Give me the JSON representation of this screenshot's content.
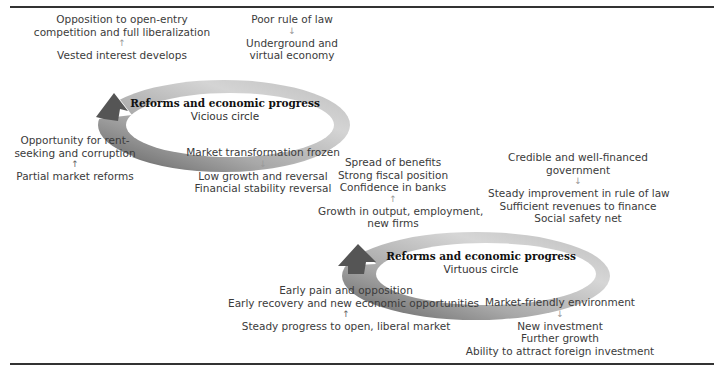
{
  "vicious": {
    "title": "Reforms and economic progress",
    "subtitle": "Vicious circle",
    "top_left": {
      "lines": [
        "Opposition to open-entry",
        "competition and full liberalization"
      ],
      "arrow": "↑",
      "lines2": [
        "Vested interest develops"
      ]
    },
    "top_right": {
      "lines": [
        "Poor rule of law"
      ],
      "arrow": "↓",
      "lines2": [
        "Underground and",
        "virtual economy"
      ]
    },
    "bottom_left": {
      "lines": [
        "Opportunity for rent-",
        "seeking and corruption"
      ],
      "arrow": "↑",
      "lines2": [
        "Partial market reforms"
      ]
    },
    "bottom_right": {
      "lines": [
        "Market transformation frozen"
      ],
      "arrow": "↓",
      "lines2": [
        "Low growth and reversal",
        "Financial stability reversal"
      ]
    }
  },
  "virtuous": {
    "title": "Reforms and economic progress",
    "subtitle": "Virtuous circle",
    "top_left": {
      "lines": [
        "Spread of benefits",
        "Strong fiscal position",
        "Confidence in banks"
      ],
      "arrow": "↑",
      "lines2": [
        "Growth in output, employment,",
        "new firms"
      ]
    },
    "top_right": {
      "lines": [
        "Credible and well-financed",
        "government"
      ],
      "arrow": "↓",
      "lines2": [
        "Steady improvement in rule of law",
        "Sufficient revenues to finance",
        "Social safety net"
      ]
    },
    "bottom_left": {
      "lines": [
        "Early pain and opposition",
        "Early recovery and new economic opportunities"
      ],
      "arrow": "↑",
      "lines2": [
        "Steady progress to open, liberal market"
      ]
    },
    "bottom_right": {
      "lines": [
        "Market-friendly environment"
      ],
      "arrow": "↓",
      "lines2": [
        "New investment",
        "Further growth",
        "Ability to attract foreign investment"
      ]
    }
  },
  "colors": {
    "ring_light": "#e6e6e6",
    "ring_mid": "#b5b5b5",
    "ring_dark": "#6e6e6e",
    "rule": "#333333"
  }
}
